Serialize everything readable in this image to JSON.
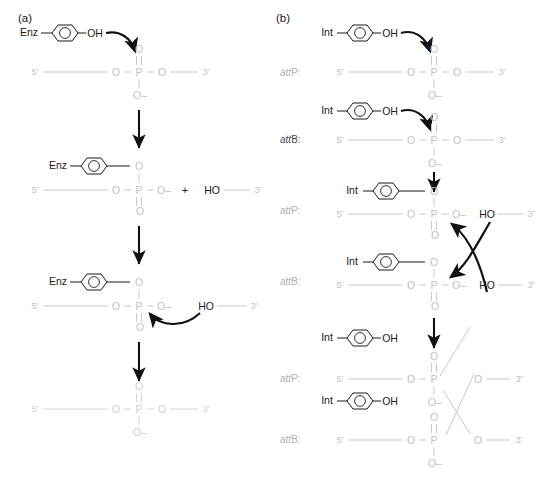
{
  "figure": {
    "panels": [
      {
        "id": "a",
        "label": "(a)",
        "title": "Topoisomerase-type single-strand transesterification"
      },
      {
        "id": "b",
        "label": "(b)",
        "title": "Integrase-mediated strand exchange between attP and attB"
      }
    ],
    "colors": {
      "dna_backbone": "#c9c9c9",
      "dna_backbone_light": "#d4d4d4",
      "protein_black": "#1a1a1a",
      "arrow_black": "#111111",
      "label_gray": "#a8a8a8",
      "label_dark": "#333333",
      "background": "#ffffff"
    },
    "glyphs": {
      "enzyme_a": "Enz",
      "enzyme_b": "Int",
      "hydroxyl": "OH",
      "hydroxyl_free": "HO",
      "oxygen": "O",
      "oxygen_anion": "O–",
      "phosphorus": "P",
      "five_prime": "5'",
      "three_prime": "3'",
      "plus": "+",
      "att_italic": "att",
      "attP_suffix": "P:",
      "attB_suffix": "B:"
    }
  },
  "panel_a": {
    "label": "(a)",
    "steps": [
      {
        "index": 1,
        "name": "nucleophilic-attack",
        "enzyme": "Enz",
        "enzyme_hydroxyl": "OH",
        "backbone_five": "5'",
        "backbone_three": "3'",
        "phosphate_top_o": "O",
        "phosphate_left_o": "O",
        "phosphate_right_o": "O",
        "phosphate_bottom_o": "O–",
        "phosphorus": "P",
        "arrow": "curved-attack-arrow"
      },
      {
        "index": 2,
        "name": "covalent-intermediate",
        "enzyme": "Enz",
        "linker_o": "O",
        "backbone_five": "5'",
        "backbone_three": "3'",
        "phosphate_left_o": "O",
        "phosphate_right_o": "O–",
        "phosphate_bottom_o": "O",
        "phosphorus": "P",
        "plus": "+",
        "free_hydroxyl": "HO"
      },
      {
        "index": 3,
        "name": "resolution-attack",
        "enzyme": "Enz",
        "linker_o": "O",
        "backbone_five": "5'",
        "backbone_three": "3'",
        "phosphate_left_o": "O",
        "phosphate_right_o": "O–",
        "phosphate_bottom_o": "O",
        "phosphorus": "P",
        "free_hydroxyl": "HO",
        "arrow": "curved-resolution-arrow"
      },
      {
        "index": 4,
        "name": "religated-product",
        "backbone_five": "5'",
        "backbone_three": "3'",
        "phosphate_top_o": "O",
        "phosphate_left_o": "O",
        "phosphate_right_o": "O",
        "phosphate_bottom_o": "O–",
        "phosphorus": "P"
      }
    ],
    "vertical_arrows": 3
  },
  "panel_b": {
    "label": "(b)",
    "steps": [
      {
        "index": 1,
        "name": "attP-attack",
        "site_label_italic": "att",
        "site_label_rest": "P:",
        "enzyme": "Int",
        "enzyme_hydroxyl": "OH",
        "backbone_five": "5'",
        "backbone_three": "3'",
        "phosphate_top_o": "O",
        "phosphate_left_o": "O",
        "phosphate_right_o": "O",
        "phosphate_bottom_o": "O–",
        "phosphorus": "P"
      },
      {
        "index": 2,
        "name": "attB-attack",
        "site_label_italic": "att",
        "site_label_rest": "B:",
        "enzyme": "Int",
        "enzyme_hydroxyl": "OH",
        "backbone_five": "5'",
        "backbone_three": "3'",
        "phosphate_top_o": "O",
        "phosphate_left_o": "O",
        "phosphate_right_o": "O",
        "phosphate_bottom_o": "O–",
        "phosphorus": "P"
      },
      {
        "index": 3,
        "name": "attP-covalent-intermediate",
        "site_label_italic": "att",
        "site_label_rest": "P:",
        "enzyme": "Int",
        "linker_o": "O",
        "backbone_five": "5'",
        "backbone_three": "3'",
        "phosphate_left_o": "O",
        "phosphate_right_o": "O–",
        "phosphate_bottom_o": "O",
        "phosphorus": "P",
        "free_hydroxyl": "HO"
      },
      {
        "index": 4,
        "name": "attB-covalent-intermediate",
        "site_label_italic": "att",
        "site_label_rest": "B:",
        "enzyme": "Int",
        "linker_o": "O",
        "backbone_five": "5'",
        "backbone_three": "3'",
        "phosphate_left_o": "O",
        "phosphate_right_o": "O–",
        "phosphate_bottom_o": "O",
        "phosphorus": "P",
        "free_hydroxyl": "HO"
      },
      {
        "index": 5,
        "name": "attP-recombinant-product",
        "site_label_italic": "att",
        "site_label_rest": "P:",
        "enzyme": "Int",
        "enzyme_hydroxyl": "OH",
        "backbone_five": "5'",
        "backbone_three": "3'",
        "phosphate_top_o": "O",
        "phosphate_left_o": "O",
        "phosphate_right_o": "O",
        "phosphate_bottom_o": "O–",
        "phosphorus": "P"
      },
      {
        "index": 6,
        "name": "attB-recombinant-product",
        "site_label_italic": "att",
        "site_label_rest": "B:",
        "enzyme": "Int",
        "enzyme_hydroxyl": "OH",
        "backbone_five": "5'",
        "backbone_three": "3'",
        "phosphate_top_o": "O",
        "phosphate_left_o": "O",
        "phosphate_right_o": "O",
        "phosphate_bottom_o": "O–",
        "phosphorus": "P"
      }
    ],
    "crossover_arrows": 2,
    "vertical_arrows": 2
  }
}
